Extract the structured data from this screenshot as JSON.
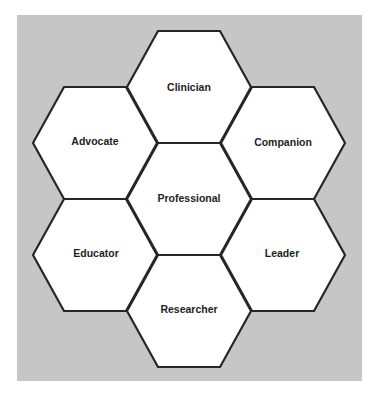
{
  "diagram": {
    "type": "hexagon-cluster",
    "background_color": "#ffffff",
    "panel_color": "#c6c6c6",
    "hex_fill": "#ffffff",
    "hex_stroke": "#262626",
    "text_color": "#1e1e1e",
    "center": {
      "label": "Professional"
    },
    "hexagons": [
      {
        "id": "clinician",
        "label": "Clinician",
        "position": "top"
      },
      {
        "id": "advocate",
        "label": "Advocate",
        "position": "upper-left"
      },
      {
        "id": "companion",
        "label": "Companion",
        "position": "upper-right"
      },
      {
        "id": "professional",
        "label": "Professional",
        "position": "center"
      },
      {
        "id": "educator",
        "label": "Educator",
        "position": "lower-left"
      },
      {
        "id": "leader",
        "label": "Leader",
        "position": "lower-right"
      },
      {
        "id": "researcher",
        "label": "Researcher",
        "position": "bottom"
      }
    ]
  }
}
